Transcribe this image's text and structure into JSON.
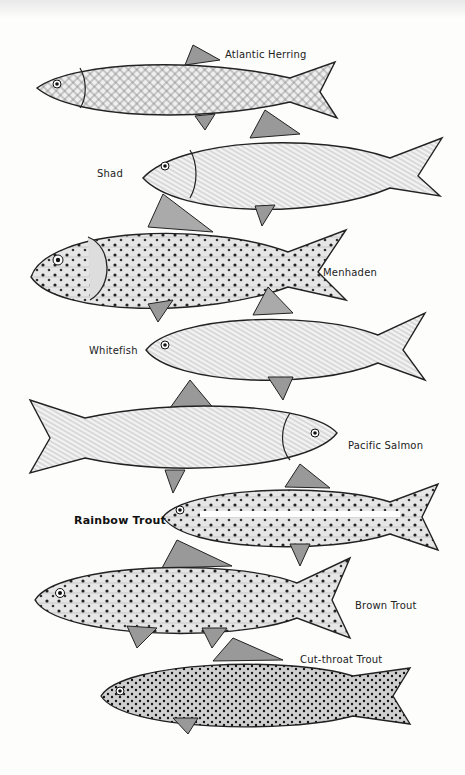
{
  "fish": [
    {
      "name": "Atlantic Herring"
    },
    {
      "name": "Shad"
    },
    {
      "name": "Menhaden"
    },
    {
      "name": "Whitefish"
    },
    {
      "name": "Pacific Salmon"
    },
    {
      "name": "Rainbow Trout"
    },
    {
      "name": "Brown Trout"
    },
    {
      "name": "Cut-throat Trout"
    }
  ]
}
